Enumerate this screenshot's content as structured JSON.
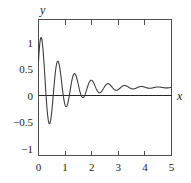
{
  "chart_data": {
    "type": "line",
    "title": "",
    "subtitle": "",
    "xlabel": "x",
    "ylabel": "y",
    "xlim": [
      0,
      5
    ],
    "ylim": [
      -1.3,
      1.3
    ],
    "grid": false,
    "legend": null,
    "x_ticks": [
      0,
      1,
      2,
      3,
      4,
      5
    ],
    "x_tick_labels": [
      "0",
      "1",
      "2",
      "3",
      "4",
      "5"
    ],
    "y_ticks": [
      -1,
      -0.5,
      0,
      0.5,
      1
    ],
    "y_tick_labels": [
      "−1",
      "−0.5",
      "0",
      "0.5",
      "1"
    ],
    "zero_line": 0,
    "series": [
      {
        "name": "damped oscillation",
        "color": "#3d3d3d",
        "description": "Exponentially damped cosine-like oscillation, amplitude decaying from about 0.9 near x=0.15 to under 0.05 by x=5",
        "x": [
          0,
          0.05,
          0.1,
          0.15,
          0.2,
          0.25,
          0.3,
          0.35,
          0.4,
          0.45,
          0.5,
          0.55,
          0.6,
          0.65,
          0.7,
          0.75,
          0.8,
          0.85,
          0.9,
          0.95,
          1.0,
          1.1,
          1.2,
          1.3,
          1.4,
          1.5,
          1.6,
          1.7,
          1.8,
          1.9,
          2.0,
          2.2,
          2.4,
          2.6,
          2.8,
          3.0,
          3.2,
          3.4,
          3.6,
          3.8,
          4.0,
          4.2,
          4.4,
          4.6,
          4.8,
          5.0
        ],
        "y": [
          0.5,
          0.82,
          0.9,
          0.78,
          0.42,
          -0.05,
          -0.48,
          -0.72,
          -0.73,
          -0.52,
          -0.16,
          0.22,
          0.5,
          0.57,
          0.45,
          0.16,
          -0.16,
          -0.4,
          -0.48,
          -0.39,
          -0.15,
          0.3,
          0.38,
          0.2,
          -0.12,
          -0.32,
          -0.29,
          -0.07,
          0.17,
          0.26,
          0.17,
          -0.15,
          0.13,
          -0.1,
          0.09,
          -0.08,
          0.07,
          -0.06,
          0.05,
          -0.04,
          0.04,
          -0.03,
          0.03,
          -0.02,
          0.02,
          -0.02
        ]
      }
    ]
  },
  "axes": {
    "y_axis_label": "y",
    "x_axis_label": "x"
  }
}
